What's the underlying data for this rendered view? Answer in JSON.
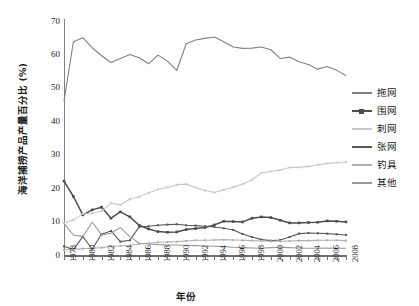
{
  "chart_data": {
    "type": "line",
    "title": "",
    "xlabel": "年份",
    "ylabel": "海洋捕捞产品产量百分比 (%)",
    "ylim": [
      0,
      70
    ],
    "ytick_values": [
      0,
      10,
      20,
      30,
      40,
      50,
      60,
      70
    ],
    "xlim": [
      1978,
      2008
    ],
    "x": [
      1978,
      1979,
      1980,
      1981,
      1982,
      1983,
      1984,
      1985,
      1986,
      1987,
      1988,
      1989,
      1990,
      1991,
      1992,
      1993,
      1994,
      1995,
      1996,
      1997,
      1998,
      1999,
      2000,
      2001,
      2002,
      2003,
      2004,
      2005,
      2006,
      2007,
      2008
    ],
    "xtick_labels": [
      "1978",
      "1980",
      "1982",
      "1984",
      "1986",
      "1988",
      "1990",
      "1992",
      "1994",
      "1996",
      "1998",
      "2000",
      "2002",
      "2004",
      "2006",
      "2008"
    ],
    "grid": false,
    "legend_position": "right",
    "series": [
      {
        "name": "拖网",
        "color": "#808080",
        "values": [
          46.0,
          63.8,
          65.0,
          62.0,
          59.6,
          57.6,
          58.8,
          60.0,
          59.0,
          57.2,
          59.8,
          58.0,
          55.2,
          63.2,
          64.3,
          64.8,
          65.2,
          63.8,
          62.2,
          61.8,
          61.9,
          62.2,
          61.4,
          58.8,
          59.2,
          57.8,
          57.0,
          55.6,
          56.4,
          55.3,
          53.6
        ]
      },
      {
        "name": "围网",
        "color": "#4d4d4d",
        "values": [
          22.1,
          17.5,
          12.0,
          13.5,
          14.3,
          11.0,
          12.9,
          11.4,
          8.9,
          7.8,
          7.0,
          6.8,
          6.9,
          7.6,
          7.9,
          8.2,
          9.0,
          10.1,
          10.0,
          9.9,
          11.0,
          11.4,
          11.2,
          10.4,
          9.6,
          9.6,
          9.7,
          9.8,
          10.2,
          10.1,
          9.9
        ]
      },
      {
        "name": "刺网",
        "color": "#c8c8c8",
        "values": [
          9.6,
          10.5,
          12.3,
          12.5,
          13.1,
          15.5,
          15.0,
          16.7,
          17.4,
          18.6,
          19.6,
          20.2,
          21.0,
          21.2,
          20.2,
          19.3,
          18.7,
          19.5,
          20.3,
          21.2,
          22.5,
          24.6,
          25.0,
          25.4,
          26.2,
          26.2,
          26.5,
          27.0,
          27.4,
          27.6,
          27.8
        ]
      },
      {
        "name": "张网",
        "color": "#585858",
        "values": [
          2.6,
          1.6,
          5.5,
          1.8,
          6.2,
          7.2,
          4.0,
          4.4,
          8.4,
          8.6,
          8.9,
          9.1,
          9.2,
          8.9,
          8.8,
          8.6,
          8.4,
          8.0,
          7.5,
          6.3,
          5.4,
          4.6,
          4.3,
          4.5,
          5.4,
          6.4,
          6.6,
          6.5,
          6.4,
          6.2,
          6.0
        ]
      },
      {
        "name": "钓具",
        "color": "#b0b0b0",
        "values": [
          1.5,
          1.7,
          1.9,
          2.0,
          2.2,
          2.6,
          2.7,
          2.9,
          3.3,
          3.5,
          3.8,
          3.9,
          4.0,
          4.2,
          4.4,
          4.4,
          4.5,
          4.6,
          4.5,
          4.4,
          4.3,
          4.2,
          4.1,
          4.1,
          4.2,
          4.3,
          4.3,
          4.4,
          4.4,
          4.4,
          4.3
        ]
      },
      {
        "name": "其他",
        "color": "#999999",
        "values": [
          9.4,
          6.0,
          5.5,
          9.8,
          6.0,
          6.5,
          8.2,
          5.5,
          3.5,
          3.3,
          3.1,
          3.0,
          3.0,
          2.9,
          2.8,
          2.7,
          2.6,
          2.5,
          2.3,
          2.2,
          2.1,
          2.0,
          2.2,
          2.3,
          2.2,
          2.1,
          2.0,
          2.0,
          2.1,
          2.0,
          2.0
        ]
      }
    ]
  },
  "legend": {
    "items": [
      {
        "label": "拖网",
        "color": "#808080",
        "marker": false
      },
      {
        "label": "围网",
        "color": "#4d4d4d",
        "marker": true
      },
      {
        "label": "刺网",
        "color": "#c8c8c8",
        "marker": false
      },
      {
        "label": "张网",
        "color": "#585858",
        "marker": false
      },
      {
        "label": "钓具",
        "color": "#b0b0b0",
        "marker": false
      },
      {
        "label": "其他",
        "color": "#999999",
        "marker": false
      }
    ]
  }
}
